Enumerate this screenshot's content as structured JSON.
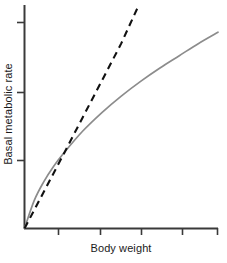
{
  "chart_data": {
    "type": "line",
    "title": "",
    "subtitle": "",
    "xlabel": "Body weight",
    "ylabel": "Basal metabolic rate",
    "grid": false,
    "legend": "none",
    "xlim": [
      0,
      1
    ],
    "ylim": [
      0,
      1
    ],
    "x_ticks_labeled": false,
    "y_ticks_labeled": false,
    "x_tick_positions": [
      0.175,
      0.39,
      0.6,
      0.81,
      1.0
    ],
    "y_tick_positions": [
      0.305,
      0.61,
      0.925
    ],
    "axis_color": "#3a3a3a",
    "series": [
      {
        "name": "Isometric (linear) prediction",
        "style": "dashed",
        "color": "#111111",
        "x": [
          0.0,
          0.1,
          0.2,
          0.3,
          0.4,
          0.5,
          0.587
        ],
        "y": [
          0.0,
          0.165,
          0.33,
          0.497,
          0.663,
          0.83,
          0.995
        ]
      },
      {
        "name": "Observed allometric scaling",
        "style": "solid",
        "color": "#8c8c8c",
        "x": [
          0.0,
          0.05,
          0.1,
          0.15,
          0.2,
          0.3,
          0.4,
          0.5,
          0.6,
          0.7,
          0.8,
          0.9,
          1.0
        ],
        "y": [
          0.0,
          0.125,
          0.21,
          0.278,
          0.335,
          0.436,
          0.52,
          0.594,
          0.66,
          0.72,
          0.775,
          0.83,
          0.88
        ]
      }
    ],
    "annotations": []
  }
}
